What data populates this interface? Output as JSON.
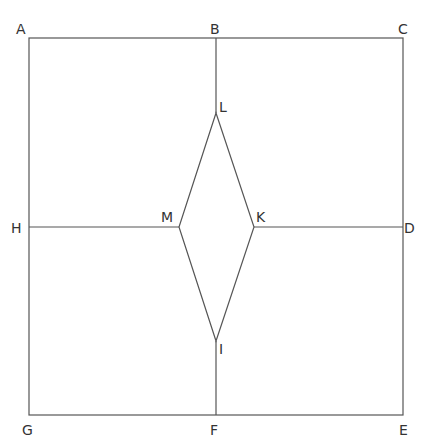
{
  "diagram": {
    "type": "geometric-figure",
    "stroke_color": "#555555",
    "label_color": "#333333",
    "points": {
      "A": {
        "label": "A",
        "x": 29,
        "y": 38
      },
      "B": {
        "label": "B",
        "x": 216,
        "y": 38
      },
      "C": {
        "label": "C",
        "x": 403,
        "y": 38
      },
      "D": {
        "label": "D",
        "x": 403,
        "y": 227
      },
      "E": {
        "label": "E",
        "x": 403,
        "y": 415
      },
      "F": {
        "label": "F",
        "x": 216,
        "y": 415
      },
      "G": {
        "label": "G",
        "x": 29,
        "y": 415
      },
      "H": {
        "label": "H",
        "x": 29,
        "y": 227
      },
      "L": {
        "label": "L",
        "x": 216,
        "y": 113
      },
      "M": {
        "label": "M",
        "x": 179,
        "y": 227
      },
      "K": {
        "label": "K",
        "x": 254,
        "y": 227
      },
      "I": {
        "label": "I",
        "x": 216,
        "y": 341
      }
    },
    "segments": [
      [
        "A",
        "C"
      ],
      [
        "C",
        "E"
      ],
      [
        "E",
        "G"
      ],
      [
        "G",
        "A"
      ],
      [
        "B",
        "L"
      ],
      [
        "F",
        "I"
      ],
      [
        "H",
        "M"
      ],
      [
        "K",
        "D"
      ],
      [
        "L",
        "K"
      ],
      [
        "K",
        "I"
      ],
      [
        "I",
        "M"
      ],
      [
        "M",
        "L"
      ]
    ]
  }
}
